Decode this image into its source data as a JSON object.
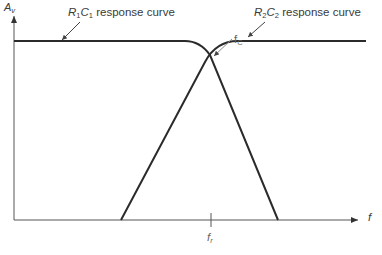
{
  "diagram": {
    "type": "frequency-response",
    "y_axis": {
      "label": "A",
      "label_sub": "v"
    },
    "x_axis": {
      "label": "f"
    },
    "curves": [
      {
        "name": "R1C1",
        "r": "R",
        "r_sub": "1",
        "c": "C",
        "c_sub": "1",
        "suffix": " response curve",
        "kind": "low-pass"
      },
      {
        "name": "R2C2",
        "r": "R",
        "r_sub": "2",
        "c": "C",
        "c_sub": "2",
        "suffix": " response curve",
        "kind": "high-pass"
      }
    ],
    "annotations": {
      "crossover": {
        "main": "f",
        "sub": "C"
      },
      "resonant": {
        "main": "f",
        "sub": "r"
      }
    },
    "colors": {
      "curve": "#2b2b2b",
      "axis": "#555555",
      "text": "#3a3a3a"
    }
  }
}
